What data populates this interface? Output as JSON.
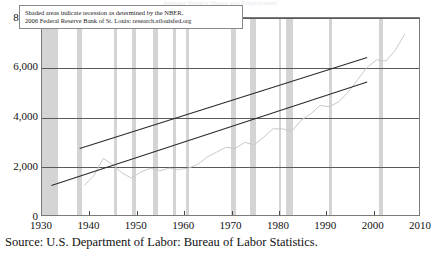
{
  "figure": {
    "title_ghost": "Average Weekly Hours and Employment",
    "source_caption": "Source: U.S. Department of Labor: Bureau of Labor Statistics.",
    "annotation": {
      "line1": "Shaded areas indicate recession as determined by the NBER,",
      "line2": "2006 Federal Reserve Bank of St. Louis: research.stlouisfed.org"
    },
    "colors": {
      "recession_band": "#d4d4d4",
      "gridline": "#5a5a5a",
      "frame": "#7a7a7a",
      "data_series": "#c8c8c8",
      "trend_line": "#2b2b2b"
    }
  },
  "chart_data": {
    "type": "line",
    "title": "",
    "xlabel": "",
    "ylabel": "",
    "xlim": [
      1930,
      2010
    ],
    "ylim": [
      0,
      8000
    ],
    "grid": true,
    "legend": "none",
    "xticks": [
      1930,
      1940,
      1950,
      1960,
      1970,
      1980,
      1990,
      2000,
      2010
    ],
    "xtick_labels": [
      "1930",
      "1940",
      "1950",
      "1960",
      "1970",
      "1980",
      "1990",
      "2000",
      "2010"
    ],
    "yticks": [
      0,
      2000,
      4000,
      6000,
      8000
    ],
    "ytick_labels": [
      "0",
      "2,000",
      "4,000",
      "6,000",
      "8,000"
    ],
    "series": [
      {
        "name": "Employment series",
        "style": "jagged-light-gray",
        "x": [
          1939,
          1941,
          1943,
          1945,
          1947,
          1949,
          1951,
          1953,
          1955,
          1957,
          1959,
          1961,
          1963,
          1965,
          1967,
          1969,
          1971,
          1973,
          1975,
          1977,
          1979,
          1981,
          1983,
          1985,
          1987,
          1989,
          1991,
          1993,
          1995,
          1997,
          1999,
          2001,
          2003,
          2005,
          2007
        ],
        "values": [
          1200,
          1600,
          2300,
          2050,
          1700,
          1500,
          1750,
          1900,
          1800,
          1900,
          1850,
          1900,
          2050,
          2350,
          2550,
          2750,
          2700,
          2950,
          2850,
          3150,
          3500,
          3500,
          3400,
          3850,
          4100,
          4450,
          4400,
          4600,
          5000,
          5500,
          6000,
          6300,
          6250,
          6700,
          7350
        ]
      },
      {
        "name": "Upper trend line",
        "style": "straight-dark",
        "x": [
          1938,
          1999
        ],
        "values": [
          2700,
          6400
        ]
      },
      {
        "name": "Lower trend line",
        "style": "straight-dark",
        "x": [
          1932,
          1999
        ],
        "values": [
          1200,
          5400
        ]
      }
    ],
    "recession_bands": [
      {
        "start": 1929.6,
        "end": 1933.3
      },
      {
        "start": 1937.4,
        "end": 1938.5
      },
      {
        "start": 1945.1,
        "end": 1945.8
      },
      {
        "start": 1948.9,
        "end": 1949.8
      },
      {
        "start": 1953.5,
        "end": 1954.4
      },
      {
        "start": 1957.6,
        "end": 1958.3
      },
      {
        "start": 1960.3,
        "end": 1961.1
      },
      {
        "start": 1969.9,
        "end": 1970.9
      },
      {
        "start": 1973.9,
        "end": 1975.2
      },
      {
        "start": 1980.1,
        "end": 1980.5
      },
      {
        "start": 1981.5,
        "end": 1982.9
      },
      {
        "start": 1990.5,
        "end": 1991.2
      },
      {
        "start": 2001.2,
        "end": 2001.9
      }
    ]
  }
}
